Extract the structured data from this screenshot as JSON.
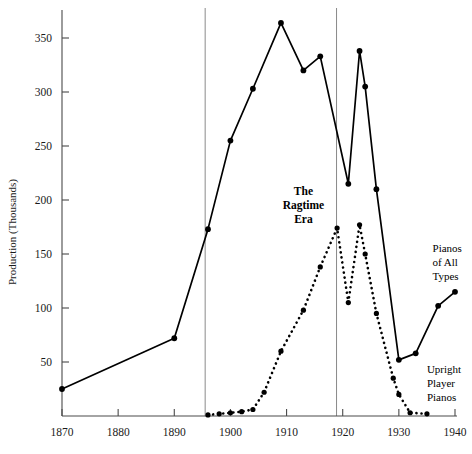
{
  "chart_data": {
    "type": "line",
    "title": "",
    "subtitle": "",
    "xlabel": "",
    "ylabel": "Production (Thousands)",
    "xlim": [
      1868,
      1941
    ],
    "ylim": [
      0,
      372
    ],
    "grid": false,
    "legend_position": "inline-annotations",
    "xticks": [
      1870,
      1880,
      1890,
      1900,
      1910,
      1920,
      1930,
      1940
    ],
    "xtick_labels": [
      "1870",
      "1880",
      "1890",
      "1900",
      "1910",
      "1920",
      "1930",
      "1940"
    ],
    "yticks": [
      50,
      100,
      150,
      200,
      250,
      300,
      350
    ],
    "ytick_labels": [
      "50",
      "100",
      "150",
      "200",
      "250",
      "300",
      "350"
    ],
    "series": [
      {
        "name": "Pianos of All Types",
        "style": "solid",
        "marker": "filled-circle",
        "x": [
          1870,
          1890,
          1896,
          1900,
          1904,
          1909,
          1913,
          1916,
          1921,
          1923,
          1924,
          1926,
          1930,
          1933,
          1937,
          1940
        ],
        "values": [
          25,
          72,
          173,
          255,
          303,
          364,
          320,
          333,
          215,
          338,
          305,
          210,
          52,
          58,
          102,
          115
        ]
      },
      {
        "name": "Upright Player Pianos",
        "style": "dotted",
        "marker": "filled-circle",
        "x": [
          1896,
          1898,
          1900,
          1902,
          1904,
          1906,
          1909,
          1913,
          1916,
          1919,
          1921,
          1923,
          1924,
          1926,
          1929,
          1930,
          1932,
          1935
        ],
        "values": [
          1,
          2,
          3,
          4,
          6,
          22,
          60,
          98,
          138,
          174,
          105,
          177,
          150,
          95,
          35,
          20,
          3,
          2
        ]
      }
    ],
    "annotations": [
      {
        "name": "ragtime-era",
        "lines": [
          "The",
          "Ragtime",
          "Era"
        ],
        "x": 1913,
        "y": 205,
        "bold": true
      },
      {
        "name": "pianos-of-all-types",
        "lines": [
          "Pianos",
          "of All",
          "Types"
        ],
        "x": 1936,
        "y": 152,
        "bold": false
      },
      {
        "name": "upright-player-pianos",
        "lines": [
          "Upright",
          "Player",
          "Pianos"
        ],
        "x": 1935,
        "y": 40,
        "bold": false
      }
    ],
    "reference_lines": [
      {
        "name": "ragtime-era-start",
        "x": 1895.5
      },
      {
        "name": "ragtime-era-end",
        "x": 1918.9
      }
    ]
  },
  "axis": {
    "y_title": "Production (Thousands)"
  },
  "colors": {
    "line": "#000000",
    "axis": "#4a4a4a",
    "reference_line": "#8a8a8a",
    "background": "#ffffff",
    "text": "#1a1a1a"
  }
}
